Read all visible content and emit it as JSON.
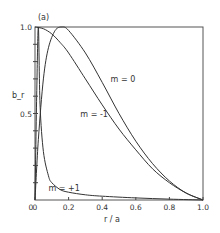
{
  "chart_data": {
    "type": "line",
    "panel_label": "(a)",
    "title": "",
    "xlabel": "r / a",
    "ylabel": "b_r",
    "xlim": [
      0,
      1.0
    ],
    "ylim": [
      0,
      1.0
    ],
    "x_ticks": [
      "0",
      "0.2",
      "0.4",
      "0.6",
      "0.8",
      "1.0"
    ],
    "y_ticks": [
      "0.5",
      "1.0"
    ],
    "grid": false,
    "legend": "inline labels",
    "series": [
      {
        "name": "m = 0",
        "x": [
          0.0,
          0.05,
          0.1,
          0.15,
          0.2,
          0.3,
          0.4,
          0.5,
          0.6,
          0.7,
          0.8,
          0.9,
          1.0
        ],
        "y": [
          1.0,
          0.99,
          0.96,
          0.91,
          0.85,
          0.7,
          0.55,
          0.41,
          0.29,
          0.18,
          0.1,
          0.04,
          0.0
        ]
      },
      {
        "name": "m = -1",
        "x": [
          0.0,
          0.02,
          0.05,
          0.08,
          0.12,
          0.16,
          0.2,
          0.3,
          0.4,
          0.5,
          0.6,
          0.7,
          0.8,
          0.9,
          1.0
        ],
        "y": [
          0.0,
          0.35,
          0.7,
          0.88,
          0.98,
          1.0,
          0.98,
          0.85,
          0.68,
          0.5,
          0.34,
          0.21,
          0.11,
          0.04,
          0.0
        ]
      },
      {
        "name": "m = +1",
        "x": [
          0.0,
          0.01,
          0.02,
          0.03,
          0.05,
          0.08,
          0.1,
          0.15,
          0.2,
          0.3,
          0.4,
          0.6,
          0.8,
          1.0
        ],
        "y": [
          0.0,
          0.6,
          1.0,
          0.55,
          0.28,
          0.14,
          0.1,
          0.06,
          0.045,
          0.03,
          0.022,
          0.012,
          0.005,
          0.0
        ]
      }
    ],
    "annotations": [
      {
        "text": "m = 0",
        "x": 0.45,
        "y": 0.68
      },
      {
        "text": "m = -1",
        "x": 0.27,
        "y": 0.48
      },
      {
        "text": "m = +1",
        "x": 0.08,
        "y": 0.05
      }
    ]
  }
}
